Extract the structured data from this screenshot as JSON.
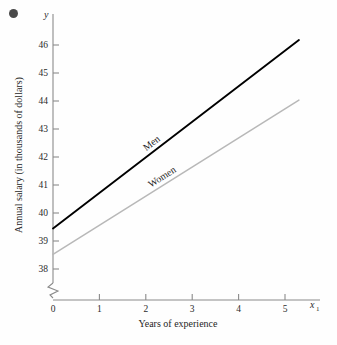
{
  "figure": {
    "bullet_marker": "bullet-dot",
    "background_color": "#fefefe"
  },
  "chart_data": {
    "type": "line",
    "title": "",
    "xlabel": "Years of experience",
    "ylabel": "Annual salary (in thousands of dollars)",
    "x_axis_variable": "x",
    "x_axis_variable_subscript": "1",
    "y_axis_variable": "y",
    "xlim": [
      0,
      5.3
    ],
    "ylim": [
      37.5,
      46.5
    ],
    "y_axis_break": true,
    "grid": false,
    "legend": "inline-labels",
    "xticks": [
      0,
      1,
      2,
      3,
      4,
      5
    ],
    "xtick_labels": [
      "0",
      "1",
      "2",
      "3",
      "4",
      "5"
    ],
    "yticks": [
      38,
      39,
      40,
      41,
      42,
      43,
      44,
      45,
      46
    ],
    "ytick_labels": [
      "38",
      "39",
      "40",
      "41",
      "42",
      "43",
      "44",
      "45",
      "46"
    ],
    "series": [
      {
        "name": "Men",
        "color": "#000000",
        "line_width": 1.9,
        "intercept": 39.45,
        "slope": 1.27,
        "x": [
          0,
          5.3
        ],
        "values": [
          39.45,
          46.18
        ]
      },
      {
        "name": "Women",
        "color": "#b8b8b8",
        "line_width": 1.5,
        "intercept": 38.52,
        "slope": 1.04,
        "x": [
          0,
          5.3
        ],
        "values": [
          38.52,
          44.03
        ]
      }
    ]
  }
}
